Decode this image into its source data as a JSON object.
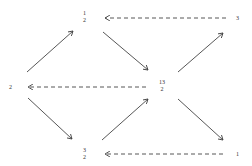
{
  "diagram": {
    "nodes": {
      "left": {
        "label": "2"
      },
      "top": {
        "numerator": "1",
        "denominator": "2"
      },
      "center": {
        "numerator": "13",
        "denominator": "2"
      },
      "bottom": {
        "numerator": "3",
        "denominator": "2"
      },
      "top_right": {
        "label": "3"
      },
      "bottom_right": {
        "label": "1"
      }
    },
    "edges": [
      {
        "from": "left",
        "to": "top",
        "style": "solid"
      },
      {
        "from": "top",
        "to": "center",
        "style": "solid"
      },
      {
        "from": "center",
        "to": "top_right",
        "style": "solid"
      },
      {
        "from": "left",
        "to": "bottom",
        "style": "solid"
      },
      {
        "from": "bottom",
        "to": "center",
        "style": "solid"
      },
      {
        "from": "center",
        "to": "bottom_right",
        "style": "solid"
      },
      {
        "from": "top_right",
        "to": "top",
        "style": "dashed"
      },
      {
        "from": "center",
        "to": "left",
        "style": "dashed"
      },
      {
        "from": "bottom_right",
        "to": "bottom",
        "style": "dashed"
      }
    ],
    "colors": {
      "line": "#444444",
      "text": "#333333",
      "background": "#ffffff"
    }
  }
}
